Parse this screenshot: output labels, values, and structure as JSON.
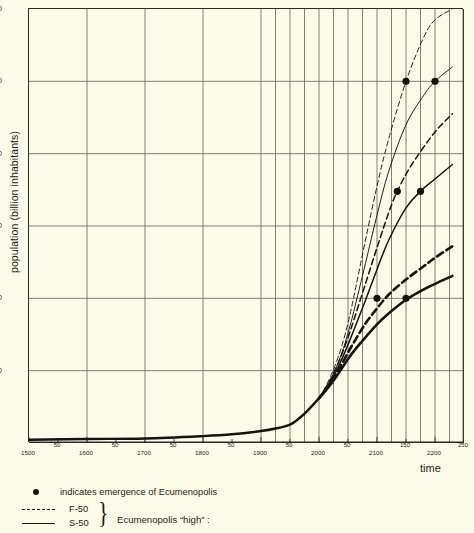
{
  "axes": {
    "y_title": "population (billion inhabitants)",
    "x_title": "time",
    "y_ticks": [
      {
        "value": 60,
        "label": "60"
      },
      {
        "value": 50,
        "label": "50"
      },
      {
        "value": 40,
        "label": "40"
      },
      {
        "value": 30,
        "label": "30"
      },
      {
        "value": 20,
        "label": "20"
      },
      {
        "value": 10,
        "label": "10"
      }
    ],
    "x_ticks": [
      {
        "value": 1500,
        "label": "1500",
        "major": true
      },
      {
        "value": 1550,
        "label": "50",
        "major": false
      },
      {
        "value": 1600,
        "label": "1600",
        "major": true
      },
      {
        "value": 1650,
        "label": "50",
        "major": false
      },
      {
        "value": 1700,
        "label": "1700",
        "major": true
      },
      {
        "value": 1750,
        "label": "50",
        "major": false
      },
      {
        "value": 1800,
        "label": "1800",
        "major": true
      },
      {
        "value": 1850,
        "label": "50",
        "major": false
      },
      {
        "value": 1900,
        "label": "1900",
        "major": true
      },
      {
        "value": 1950,
        "label": "50",
        "major": false
      },
      {
        "value": 2000,
        "label": "2000",
        "major": true
      },
      {
        "value": 2050,
        "label": "50",
        "major": false
      },
      {
        "value": 2100,
        "label": "2100",
        "major": true
      },
      {
        "value": 2150,
        "label": "150",
        "major": false
      },
      {
        "value": 2200,
        "label": "2200",
        "major": true
      },
      {
        "value": 2250,
        "label": "250",
        "major": false
      }
    ]
  },
  "legend": {
    "dot_text": "indicates emergence of Ecumenopolis",
    "f50_label": "F-50",
    "s50_label": "S-50",
    "brace": "}",
    "group_label": "Ecumenopolis “high” :"
  },
  "colors": {
    "background": "#fcfbe8",
    "ink": "#1c1c16",
    "grid": "#6b6a58",
    "axis": "#2b2b22"
  },
  "chart_data": {
    "type": "line",
    "title": "",
    "xlabel": "time",
    "ylabel": "population (billion inhabitants)",
    "xlim": [
      1500,
      2250
    ],
    "ylim": [
      0,
      60
    ],
    "grid": true,
    "legend_position": "below-plot",
    "x_gridlines_dense_from": 1900,
    "x_gridlines_dense_step": 25,
    "annotations": [
      {
        "text": "indicates emergence of Ecumenopolis",
        "marker": "filled-circle"
      }
    ],
    "emergence_points": [
      {
        "series": "F-50",
        "x": 2150,
        "y": 50
      },
      {
        "series": "S-50",
        "x": 2200,
        "y": 50
      },
      {
        "series": "F-25",
        "x": 2135,
        "y": 34.8
      },
      {
        "series": "S-25",
        "x": 2175,
        "y": 34.8
      },
      {
        "series": "F-10",
        "x": 2100,
        "y": 20
      },
      {
        "series": "S-10",
        "x": 2150,
        "y": 20
      }
    ],
    "common_history": {
      "x": [
        1500,
        1600,
        1700,
        1800,
        1850,
        1900,
        1925,
        1950,
        1960,
        1970,
        1980,
        1990,
        2000
      ],
      "y": [
        0.45,
        0.55,
        0.62,
        0.95,
        1.2,
        1.65,
        2.0,
        2.55,
        3.05,
        3.7,
        4.45,
        5.3,
        6.2
      ]
    },
    "series": [
      {
        "name": "F-50",
        "style": "dashed",
        "weight": "thin",
        "x": [
          2000,
          2010,
          2020,
          2030,
          2040,
          2050,
          2060,
          2080,
          2100,
          2120,
          2150,
          2180,
          2200,
          2230
        ],
        "y": [
          6.2,
          7.6,
          9.2,
          11.2,
          13.6,
          16.6,
          20.2,
          28.0,
          35.5,
          42.0,
          50.0,
          56.0,
          58.5,
          60.0
        ]
      },
      {
        "name": "S-50",
        "style": "solid",
        "weight": "thin",
        "x": [
          2000,
          2010,
          2020,
          2030,
          2040,
          2050,
          2060,
          2080,
          2100,
          2120,
          2150,
          2180,
          2200,
          2230
        ],
        "y": [
          6.2,
          7.4,
          8.8,
          10.5,
          12.6,
          15.2,
          18.2,
          24.8,
          31.5,
          37.5,
          44.0,
          48.0,
          50.0,
          52.0
        ]
      },
      {
        "name": "F-25",
        "style": "dashed",
        "weight": "medium",
        "x": [
          2000,
          2010,
          2020,
          2030,
          2040,
          2050,
          2060,
          2080,
          2100,
          2120,
          2135,
          2160,
          2200,
          2230
        ],
        "y": [
          6.2,
          7.4,
          8.8,
          10.5,
          12.4,
          14.6,
          17.0,
          22.0,
          27.0,
          31.8,
          34.8,
          38.5,
          43.0,
          45.5
        ]
      },
      {
        "name": "S-25",
        "style": "solid",
        "weight": "medium",
        "x": [
          2000,
          2010,
          2020,
          2030,
          2040,
          2050,
          2060,
          2080,
          2100,
          2120,
          2150,
          2175,
          2200,
          2230
        ],
        "y": [
          6.2,
          7.3,
          8.5,
          10.0,
          11.7,
          13.6,
          15.6,
          19.7,
          24.0,
          28.0,
          32.5,
          34.8,
          36.5,
          38.5
        ]
      },
      {
        "name": "F-10",
        "style": "dashed",
        "weight": "thick",
        "x": [
          2000,
          2010,
          2020,
          2030,
          2040,
          2050,
          2060,
          2080,
          2100,
          2120,
          2150,
          2180,
          2200,
          2230
        ],
        "y": [
          6.2,
          7.2,
          8.3,
          9.6,
          11.0,
          12.5,
          13.9,
          16.5,
          18.6,
          20.5,
          22.6,
          24.4,
          25.6,
          27.2
        ]
      },
      {
        "name": "S-10",
        "style": "solid",
        "weight": "thick",
        "x": [
          2000,
          2010,
          2020,
          2030,
          2040,
          2050,
          2060,
          2080,
          2100,
          2120,
          2150,
          2180,
          2200,
          2230
        ],
        "y": [
          6.2,
          7.1,
          8.1,
          9.2,
          10.4,
          11.6,
          12.7,
          14.6,
          16.4,
          17.9,
          19.8,
          21.2,
          22.0,
          23.1
        ]
      }
    ]
  }
}
